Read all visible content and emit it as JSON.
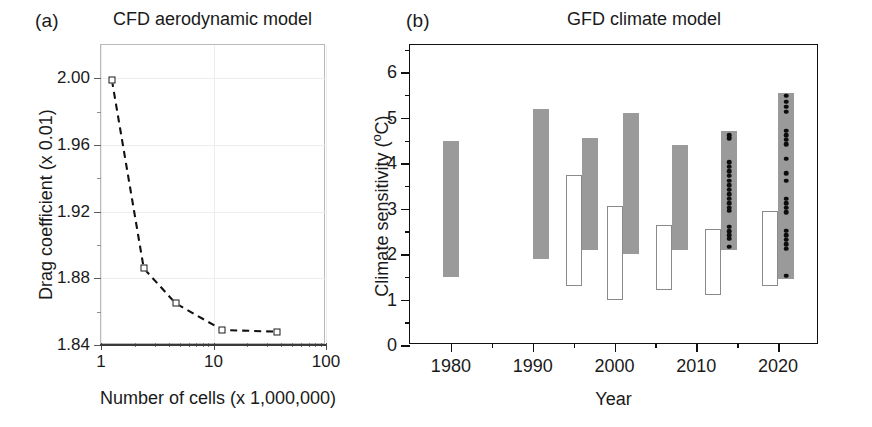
{
  "figure": {
    "width": 872,
    "height": 427,
    "background": "#ffffff",
    "panel_letters": {
      "a": "(a)",
      "b": "(b)"
    }
  },
  "chart_data": [
    {
      "id": "panel-a",
      "type": "line",
      "title": "CFD aerodynamic model",
      "panel_label": "(a)",
      "xlabel": "Number of cells (x 1,000,000)",
      "ylabel": "Drag coefficient (x 0.01)",
      "xscale": "log",
      "xlim": [
        1,
        100
      ],
      "ylim": [
        1.84,
        2.02
      ],
      "xticks": [
        1,
        10,
        100
      ],
      "xticklabels": [
        "1",
        "10",
        "100"
      ],
      "yticks": [
        1.84,
        1.88,
        1.92,
        1.96,
        2.0
      ],
      "yticklabels": [
        "1.84",
        "1.88",
        "1.92",
        "1.96",
        "2.00"
      ],
      "grid": true,
      "marker": "open-square",
      "linestyle": "dashed",
      "x": [
        1.25,
        2.4,
        4.6,
        12.0,
        37.0
      ],
      "y": [
        1.999,
        1.886,
        1.865,
        1.849,
        1.848
      ],
      "points": [
        {
          "x": 1.25,
          "y": 1.999
        },
        {
          "x": 2.4,
          "y": 1.886
        },
        {
          "x": 4.6,
          "y": 1.865
        },
        {
          "x": 12.0,
          "y": 1.849
        },
        {
          "x": 37.0,
          "y": 1.848
        }
      ]
    },
    {
      "id": "panel-b",
      "type": "bar",
      "title": "GFD climate model",
      "panel_label": "(b)",
      "xlabel": "Year",
      "ylabel": "Climate sensitivity (°C)",
      "ylabel_parts": {
        "main": "Climate sensitivity (",
        "sup": "o",
        "tail": "C)"
      },
      "xlim": [
        1975,
        2025
      ],
      "ylim": [
        0,
        6.6
      ],
      "xticks": [
        1980,
        1990,
        2000,
        2010,
        2020
      ],
      "xticklabels": [
        "1980",
        "1990",
        "2000",
        "2010",
        "2020"
      ],
      "yticks": [
        0,
        1,
        2,
        3,
        4,
        5,
        6
      ],
      "yticklabels": [
        "0",
        "1",
        "2",
        "3",
        "4",
        "5",
        "6"
      ],
      "yminorticks": [
        0.5,
        1.5,
        2.5,
        3.5,
        4.5,
        5.5,
        6.5
      ],
      "grid": false,
      "colors": {
        "filled": "#9a9a9a",
        "open": "#ffffff",
        "open_edge": "#8a8a8a",
        "dot": "#0d0d0d"
      },
      "bars": [
        {
          "year": 1980,
          "low": 1.5,
          "high": 4.5,
          "style": "filled",
          "dots": []
        },
        {
          "year": 1991,
          "low": 1.9,
          "high": 5.2,
          "style": "filled",
          "dots": []
        },
        {
          "year": 1995,
          "low": 1.3,
          "high": 3.75,
          "style": "open",
          "dots": []
        },
        {
          "year": 1997,
          "low": 2.1,
          "high": 4.55,
          "style": "filled",
          "dots": []
        },
        {
          "year": 2000,
          "low": 1.0,
          "high": 3.05,
          "style": "open",
          "dots": []
        },
        {
          "year": 2002,
          "low": 2.0,
          "high": 5.1,
          "style": "filled",
          "dots": []
        },
        {
          "year": 2006,
          "low": 1.2,
          "high": 2.65,
          "style": "open",
          "dots": []
        },
        {
          "year": 2008,
          "low": 2.1,
          "high": 4.4,
          "style": "filled",
          "dots": []
        },
        {
          "year": 2012,
          "low": 1.1,
          "high": 2.55,
          "style": "open",
          "dots": []
        },
        {
          "year": 2014,
          "low": 2.1,
          "high": 4.7,
          "style": "filled",
          "dots": [
            4.62,
            4.55,
            4.02,
            3.92,
            3.82,
            3.72,
            3.62,
            3.52,
            3.42,
            3.32,
            3.22,
            3.12,
            3.02,
            2.95,
            2.6,
            2.5,
            2.42,
            2.34,
            2.16
          ]
        },
        {
          "year": 2019,
          "low": 1.3,
          "high": 2.95,
          "style": "open",
          "dots": []
        },
        {
          "year": 2021,
          "low": 1.45,
          "high": 5.55,
          "style": "filled",
          "dots": [
            5.48,
            5.35,
            5.24,
            5.13,
            4.72,
            4.62,
            4.52,
            4.42,
            4.1,
            3.78,
            3.62,
            3.22,
            3.12,
            3.02,
            2.92,
            2.52,
            2.42,
            2.32,
            2.22,
            2.12,
            1.52
          ]
        }
      ]
    }
  ]
}
